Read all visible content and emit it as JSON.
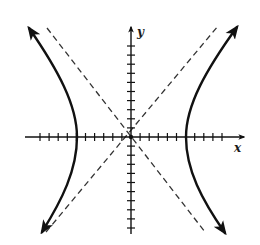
{
  "chart_data": {
    "type": "line",
    "title": "",
    "xlabel": "x",
    "ylabel": "y",
    "xlim": [
      -12,
      12
    ],
    "ylim": [
      -12,
      12
    ],
    "x_ticks": [
      -10,
      -9,
      -8,
      -7,
      -6,
      -5,
      -4,
      -3,
      -2,
      -1,
      1,
      2,
      3,
      4,
      5,
      6,
      7,
      8,
      9,
      10
    ],
    "y_ticks": [
      -10,
      -9,
      -8,
      -7,
      -6,
      -5,
      -4,
      -3,
      -2,
      -1,
      1,
      2,
      3,
      4,
      5,
      6,
      7,
      8,
      9,
      10
    ],
    "tick_labels_shown": false,
    "grid": false,
    "legend": null,
    "hyperbola": {
      "a": 6,
      "b": 7.7,
      "vertices": [
        [
          -6,
          0
        ],
        [
          6,
          0
        ]
      ],
      "branches": [
        "left",
        "right"
      ],
      "arrowheads": true
    },
    "asymptotes": {
      "style": "dashed",
      "slopes": [
        1.28,
        -1.28
      ],
      "through": [
        0,
        0
      ]
    },
    "series": [
      {
        "name": "left-branch",
        "style": "solid",
        "points": [
          [
            -11.6,
            12.1
          ],
          [
            -9,
            6.4
          ],
          [
            -7,
            3.9
          ],
          [
            -6,
            0
          ],
          [
            -7,
            -3.9
          ],
          [
            -9,
            -6.4
          ],
          [
            -10.0,
            -10.5
          ]
        ]
      },
      {
        "name": "right-branch",
        "style": "solid",
        "points": [
          [
            11.7,
            12.3
          ],
          [
            9,
            6.4
          ],
          [
            7,
            3.9
          ],
          [
            6,
            0
          ],
          [
            7,
            -3.9
          ],
          [
            9,
            -6.4
          ],
          [
            10.3,
            -10.7
          ]
        ]
      },
      {
        "name": "asymptote-positive",
        "style": "dashed",
        "points": [
          [
            -9.4,
            -10.5
          ],
          [
            9.7,
            12.3
          ]
        ]
      },
      {
        "name": "asymptote-negative",
        "style": "dashed",
        "points": [
          [
            -9.3,
            12.1
          ],
          [
            8.2,
            -10.5
          ]
        ]
      }
    ]
  },
  "labels": {
    "x_axis": "x",
    "y_axis": "y"
  },
  "colors": {
    "curve": "#111111",
    "axis": "#111111",
    "asymptote": "#333333",
    "background": "#ffffff"
  }
}
